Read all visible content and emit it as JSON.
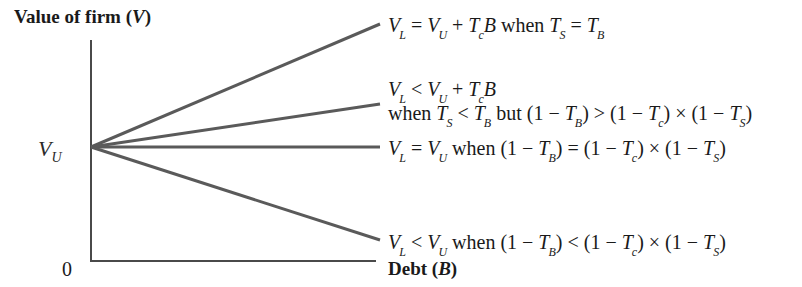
{
  "axes": {
    "y_label_text": "Value of firm (",
    "y_label_var": "V",
    "y_label_close": ")",
    "x_label_text": "Debt (",
    "x_label_var": "B",
    "x_label_close": ")",
    "origin_label": "0",
    "intercept_var": "V",
    "intercept_sub": "U"
  },
  "lines": [
    {
      "id": "tax-shield-full",
      "start": [
        91,
        147
      ],
      "end": [
        380,
        24
      ],
      "color": "#5a5a5a"
    },
    {
      "id": "tax-shield-partial",
      "start": [
        91,
        147
      ],
      "end": [
        380,
        104
      ],
      "color": "#5a5a5a"
    },
    {
      "id": "no-effect",
      "start": [
        91,
        147
      ],
      "end": [
        380,
        147
      ],
      "color": "#5a5a5a"
    },
    {
      "id": "negative-effect",
      "start": [
        91,
        147
      ],
      "end": [
        380,
        240
      ],
      "color": "#5a5a5a"
    }
  ],
  "labels": {
    "l1": {
      "a": "V",
      "as": "L",
      "b": " = ",
      "c": "V",
      "cs": "U",
      "d": " + ",
      "e": "T",
      "es": "c",
      "f": "B",
      "g": " when ",
      "h": "T",
      "hs": "S",
      "i": " = ",
      "j": "T",
      "js": "B"
    },
    "l2a": {
      "a": "V",
      "as": "L",
      "b": " < ",
      "c": "V",
      "cs": "U",
      "d": " + ",
      "e": "T",
      "es": "c",
      "f": "B"
    },
    "l2b": {
      "a": "when ",
      "b": "T",
      "bs": "S",
      "c": " < ",
      "d": "T",
      "ds": "B",
      "e": " but (1 − ",
      "f": "T",
      "fs": "B",
      "g": ") > (1 − ",
      "h": "T",
      "hs": "c",
      "i": ") × (1 − ",
      "j": "T",
      "js": "S",
      "k": ")"
    },
    "l3": {
      "a": "V",
      "as": "L",
      "b": " = ",
      "c": "V",
      "cs": "U",
      "d": " when (1 − ",
      "e": "T",
      "es": "B",
      "f": ") = (1 − ",
      "g": "T",
      "gs": "c",
      "h": ") × (1 − ",
      "i": "T",
      "is": "S",
      "j": ")"
    },
    "l4": {
      "a": "V",
      "as": "L",
      "b": " < ",
      "c": "V",
      "cs": "U",
      "d": " when (1 − ",
      "e": "T",
      "es": "B",
      "f": ") < (1 − ",
      "g": "T",
      "gs": "c",
      "h": ") × (1 − ",
      "i": "T",
      "is": "S",
      "j": ")"
    }
  },
  "colors": {
    "line": "#5a5a5a",
    "axis": "#4a4a4a",
    "text": "#1a1a1a"
  }
}
